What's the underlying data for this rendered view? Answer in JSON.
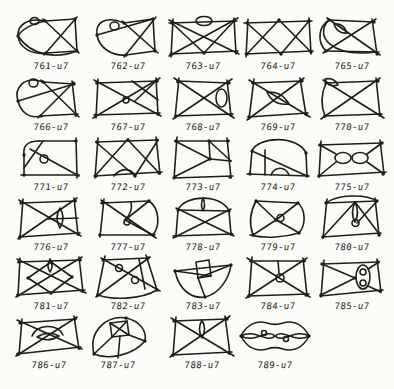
{
  "plate": {
    "title": "hand-drawn knot diagram table",
    "ink": "#211d18",
    "paper": "#fcfcf9",
    "cells": [
      {
        "label": "761-u7",
        "paths": [
          "M32,8 L62,6",
          "M62,6 L64,38",
          "M64,38 L33,40",
          "M30,6 L66,40",
          "M64,4 L31,42",
          "M32,8 C14,4 4,13 5,23 C6,34 18,42 33,40",
          "M32,8 C18,11 8,17 5,23",
          "M5,23 C20,45 46,45 64,38",
          "M17,8 a4.5,3.5 0 1,0 9,0 a4.5,3.5 0 1,0 -9,0"
        ],
        "dots": [
          [
            32,
            8
          ],
          [
            62,
            6
          ],
          [
            64,
            38
          ],
          [
            33,
            40
          ],
          [
            5,
            23
          ]
        ]
      },
      {
        "label": "762-u7",
        "paths": [
          "M34,10 L63,6",
          "M63,6 L65,38",
          "M65,38 L36,42",
          "M32,8 L68,40",
          "M66,4 L34,44",
          "M34,10 C15,2 5,10 7,22 C9,35 22,43 36,42",
          "M7,22 L63,6",
          "M20,13 a4.5,4 0 1,0 9,0 a4.5,4 0 1,0 -9,0"
        ],
        "dots": [
          [
            34,
            10
          ],
          [
            63,
            6
          ],
          [
            65,
            38
          ],
          [
            36,
            42
          ],
          [
            7,
            22
          ]
        ]
      },
      {
        "label": "763-u7",
        "paths": [
          "M4,10 L72,8",
          "M69,5 L71,41",
          "M73,38 L5,41",
          "M8,6 L6,44",
          "M4,7 L74,41",
          "M4,43 L73,5",
          "M7,10 L39,40",
          "M69,8 L39,40",
          "M31,8 a8,4.5 0 1,0 16,0 a8,4.5 0 1,0 -16,0"
        ],
        "dots": [
          [
            7,
            10
          ],
          [
            69,
            8
          ],
          [
            71,
            39
          ],
          [
            7,
            41
          ],
          [
            39,
            40
          ]
        ]
      },
      {
        "label": "764-u7",
        "paths": [
          "M4,10 L72,8",
          "M69,5 L71,41",
          "M73,38 L5,41",
          "M8,6 L6,44",
          "M7,10 L41,41",
          "M69,8 L41,41",
          "M7,41 L39,7",
          "M71,39 L39,7"
        ],
        "dots": [
          [
            7,
            10
          ],
          [
            69,
            8
          ],
          [
            71,
            39
          ],
          [
            7,
            41
          ],
          [
            39,
            7
          ],
          [
            41,
            41
          ]
        ]
      },
      {
        "label": "765-u7",
        "paths": [
          "M15,7 L60,9",
          "M58,6 L63,41",
          "M65,39 L12,38",
          "M15,7 C4,14 3,29 12,38",
          "M15,7 C0,22 16,45 63,39",
          "M13,5 L66,42",
          "M62,6 L9,40",
          "M20,11 Q30,10 33,20 Q23,21 20,11"
        ],
        "dots": [
          [
            15,
            7
          ],
          [
            60,
            9
          ],
          [
            63,
            41
          ],
          [
            12,
            38
          ]
        ]
      },
      {
        "label": "766-u7",
        "paths": [
          "M30,8 L61,10",
          "M59,7 L63,42",
          "M65,40 L27,42",
          "M30,8 C10,1 1,15 5,27 C8,39 17,45 28,42",
          "M16,9 a4.5,4 0 1,0 9,0 a4.5,4 0 1,0 -9,0",
          "M28,6 L66,43",
          "M61,8 L25,44",
          "M5,27 L61,10"
        ],
        "dots": [
          [
            30,
            8
          ],
          [
            61,
            10
          ],
          [
            63,
            41
          ],
          [
            28,
            42
          ],
          [
            5,
            27
          ]
        ]
      },
      {
        "label": "767-u7",
        "paths": [
          "M6,9 L68,7",
          "M66,4 L68,41",
          "M70,39 L4,41",
          "M8,5 L6,44",
          "M4,6 L71,42",
          "M3,44 L70,4",
          "M42,7 L68,26",
          "M66,7 L45,27",
          "M33,26 a3,3 0 1,0 6,0 a3,3 0 1,0 -6,0"
        ],
        "dots": [
          [
            7,
            9
          ],
          [
            67,
            7
          ],
          [
            68,
            40
          ],
          [
            6,
            41
          ]
        ]
      },
      {
        "label": "768-u7",
        "paths": [
          "M12,7 L64,9",
          "M62,6 L66,42",
          "M68,40 L10,42",
          "M14,4 L10,44",
          "M9,4 L69,44",
          "M67,5 L8,45",
          "M51,24 a5.5,9 0 1,0 11,0 a5.5,9 0 1,0 -11,0"
        ],
        "dots": [
          [
            13,
            8
          ],
          [
            64,
            9
          ],
          [
            66,
            41
          ],
          [
            11,
            42
          ]
        ]
      },
      {
        "label": "769-u7",
        "paths": [
          "M12,9 L62,7",
          "M60,4 L66,41",
          "M68,39 L8,43",
          "M14,5 L9,45",
          "M9,6 L70,43",
          "M64,4 L7,46",
          "M27,18 Q42,17 49,30 Q33,32 27,18"
        ],
        "dots": [
          [
            13,
            9
          ],
          [
            62,
            7
          ],
          [
            66,
            40
          ],
          [
            9,
            43
          ]
        ]
      },
      {
        "label": "770-u7",
        "paths": [
          "M12,9 L64,7",
          "M62,4 L66,42",
          "M68,40 L10,42",
          "M12,9 C7,20 7,32 11,42",
          "M9,6 L70,44",
          "M66,4 L7,45",
          "M11,5 Q20,3 24,11 Q14,14 11,5"
        ],
        "dots": [
          [
            12,
            9
          ],
          [
            64,
            7
          ],
          [
            66,
            41
          ],
          [
            11,
            42
          ]
        ]
      },
      {
        "label": "771-u7",
        "paths": [
          "M26,7 L63,7",
          "M26,7 C13,7 10,13 11,21",
          "M11,21 L11,41",
          "M8,41 L66,41",
          "M63,4 L64,44",
          "M30,7 L11,34",
          "M17,15 L66,42",
          "M27,25 a4,4 0 1,0 8,0 a4,4 0 1,0 -8,0"
        ],
        "dots": [
          [
            63,
            7
          ],
          [
            11,
            41
          ],
          [
            64,
            41
          ],
          [
            11,
            21
          ]
        ]
      },
      {
        "label": "772-u7",
        "paths": [
          "M6,8 L68,6",
          "M66,3 L70,40",
          "M72,38 L4,42",
          "M8,4 L5,44",
          "M6,8 L45,42",
          "M5,42 L38,5",
          "M38,6 L70,40",
          "M68,6 L45,42",
          "M24,42 C31,33 41,34 45,42"
        ],
        "dots": [
          [
            7,
            8
          ],
          [
            67,
            6
          ],
          [
            69,
            39
          ],
          [
            6,
            42
          ],
          [
            38,
            6
          ],
          [
            45,
            42
          ]
        ]
      },
      {
        "label": "773-u7",
        "paths": [
          "M10,7 L64,7",
          "M62,4 L66,44",
          "M68,42 L8,44",
          "M12,3 L9,45",
          "M44,7 L45,25",
          "M10,7 L45,25",
          "M9,43 L45,25",
          "M45,25 L66,27",
          "M44,7 L66,27"
        ],
        "dots": [
          [
            11,
            7
          ],
          [
            63,
            7
          ],
          [
            65,
            43
          ],
          [
            10,
            43
          ],
          [
            45,
            25
          ],
          [
            44,
            7
          ]
        ]
      },
      {
        "label": "774-u7",
        "paths": [
          "M12,17 C18,2 58,1 66,19",
          "M12,17 L10,40",
          "M7,40 L69,42",
          "M66,19 L67,42",
          "M25,16 L25,41",
          "M12,17 L67,42",
          "M31,41 C35,32 45,32 49,41"
        ],
        "dots": [
          [
            12,
            17
          ],
          [
            66,
            19
          ],
          [
            10,
            40
          ],
          [
            67,
            42
          ]
        ]
      },
      {
        "label": "775-u7",
        "paths": [
          "M5,11 L68,9",
          "M66,6 L70,40",
          "M72,38 L4,42",
          "M7,7 L5,43",
          "M21,24 a8,5.5 0 1,0 16,0 a8,5.5 0 1,0 -16,0",
          "M38,24 a8,5.5 0 1,0 16,0 a8,5.5 0 1,0 -16,0",
          "M6,11 L22,20",
          "M5,42 L22,28",
          "M68,9 L53,20",
          "M70,40 L53,28"
        ],
        "dots": [
          [
            6,
            11
          ],
          [
            68,
            9
          ],
          [
            69,
            40
          ],
          [
            5,
            42
          ]
        ]
      },
      {
        "label": "776-u7",
        "paths": [
          "M8,9 L63,7",
          "M61,4 L65,41",
          "M67,39 L6,43",
          "M10,5 L7,45",
          "M6,6 L68,42",
          "M64,4 L5,45",
          "M47,14 Q53,24 47,34 Q41,24 47,14",
          "M35,25 L65,24"
        ],
        "dots": [
          [
            8,
            9
          ],
          [
            62,
            7
          ],
          [
            65,
            40
          ],
          [
            7,
            43
          ]
        ]
      },
      {
        "label": "777-u7",
        "paths": [
          "M12,9 L59,7",
          "M59,7 C70,15 70,32 63,41",
          "M65,41 L9,41",
          "M14,5 L10,43",
          "M11,6 L66,44",
          "M59,7 L35,26",
          "M41,8 C43,16 38,23 35,26",
          "M35,26 L63,41",
          "M34,28 a3,3 0 1,0 6,0 a3,3 0 1,0 -6,0"
        ],
        "dots": [
          [
            12,
            9
          ],
          [
            59,
            7
          ],
          [
            63,
            41
          ],
          [
            10,
            41
          ]
        ]
      },
      {
        "label": "778-u7",
        "paths": [
          "M13,16 C20,0 57,0 64,17",
          "M13,16 L64,17",
          "M13,16 L11,42",
          "M8,42 L68,40",
          "M64,17 L66,40",
          "M11,14 L69,42",
          "M66,15 L8,44",
          "M38,4 Q35,11 38,17 Q41,11 38,4"
        ],
        "dots": [
          [
            13,
            16
          ],
          [
            64,
            17
          ],
          [
            11,
            42
          ],
          [
            66,
            40
          ]
        ]
      },
      {
        "label": "779-u7",
        "paths": [
          "M16,7 L58,9",
          "M16,7 C10,18 9,30 13,41",
          "M10,41 C26,45 46,43 59,39",
          "M58,9 C66,16 66,31 59,39",
          "M16,7 L36,26",
          "M58,9 L36,26",
          "M36,26 C45,31 53,35 59,39",
          "M36,26 L13,41",
          "M37,24 a3.5,3.5 0 1,0 7,0 a3.5,3.5 0 1,0 -7,0"
        ],
        "dots": [
          [
            16,
            7
          ],
          [
            58,
            9
          ],
          [
            13,
            41
          ],
          [
            59,
            39
          ],
          [
            36,
            26
          ]
        ]
      },
      {
        "label": "780-u7",
        "paths": [
          "M12,9 L63,7",
          "M61,4 L65,41",
          "M67,39 L8,43",
          "M13,5 L9,44",
          "M12,9 C24,0 52,0 63,7",
          "M9,43 L41,8",
          "M41,8 Q36,19 41,28 Q46,19 41,8",
          "M38,29 a3.5,3.5 0 1,0 7,0 a3.5,3.5 0 1,0 -7,0",
          "M41,8 L66,41",
          "M43,29 L63,7"
        ],
        "dots": [
          [
            12,
            9
          ],
          [
            63,
            7
          ],
          [
            65,
            41
          ],
          [
            9,
            43
          ]
        ]
      },
      {
        "label": "781-u7",
        "paths": [
          "M5,9 L68,7",
          "M66,4 L70,39",
          "M72,37 L4,42",
          "M7,5 L5,43",
          "M4,6 L73,40",
          "M69,4 L3,44",
          "M38,9 L15,25 L38,40 L59,24 Z",
          "M37,6 Q33,13 37,19 Q41,13 37,6"
        ],
        "dots": [
          [
            6,
            9
          ],
          [
            67,
            7
          ],
          [
            69,
            38
          ],
          [
            5,
            42
          ],
          [
            38,
            9
          ],
          [
            15,
            25
          ],
          [
            38,
            40
          ],
          [
            59,
            24
          ]
        ]
      },
      {
        "label": "782-u7",
        "paths": [
          "M13,7 L58,5",
          "M56,2 L67,37",
          "M67,37 C50,47 22,47 8,42",
          "M15,3 L7,43",
          "M11,5 L70,38",
          "M60,4 L6,44",
          "M49,6 L55,36",
          "M25.5,15 a3.5,3.5 0 1,0 7,0 a3.5,3.5 0 1,0 -7,0",
          "M41.5,27 a3.5,3.5 0 1,0 7,0 a3.5,3.5 0 1,0 -7,0"
        ],
        "dots": [
          [
            13,
            7
          ],
          [
            58,
            5
          ],
          [
            67,
            37
          ],
          [
            8,
            42
          ]
        ]
      },
      {
        "label": "783-u7",
        "paths": [
          "M10,18 L66,12",
          "M10,18 C14,38 28,46 40,44 C54,41 64,26 66,12",
          "M31,9 L44,7 L46,23 L33,25 Z",
          "M33,25 L40,44",
          "M10,18 L46,23",
          "M66,12 L33,25"
        ],
        "dots": [
          [
            10,
            18
          ],
          [
            66,
            12
          ],
          [
            40,
            44
          ]
        ]
      },
      {
        "label": "784-u7",
        "paths": [
          "M10,8 L65,8",
          "M63,5 L67,43",
          "M69,41 L8,43",
          "M12,4 L9,44",
          "M7,5 L70,44",
          "M67,5 L6,45",
          "M36,25 a4,4 0 1,0 8,0 a4,4 0 1,0 -8,0",
          "M38,8 L39,20"
        ],
        "dots": [
          [
            11,
            8
          ],
          [
            64,
            8
          ],
          [
            66,
            42
          ],
          [
            9,
            43
          ]
        ]
      },
      {
        "label": "785-u7",
        "paths": [
          "M8,11 L65,9",
          "M63,6 L67,39",
          "M69,37 L6,43",
          "M10,7 L7,44",
          "M8,11 L41,25",
          "M7,42 L41,25",
          "M42,24 a7,12 0 1,0 14,0 a7,12 0 1,0 -14,0",
          "M46,19 a3,3 0 1,0 6,0 a3,3 0 1,0 -6,0",
          "M46,30 a3,3 0 1,0 6,0 a3,3 0 1,0 -6,0",
          "M65,9 L54,16",
          "M67,39 L54,33"
        ],
        "dots": [
          [
            8,
            11
          ],
          [
            64,
            9
          ],
          [
            66,
            38
          ],
          [
            7,
            42
          ],
          [
            41,
            25
          ]
        ]
      },
      {
        "label": "786-u7",
        "paths": [
          "M9,11 L65,7",
          "M63,4 L68,37",
          "M70,35 L6,42",
          "M11,7 L8,43",
          "M6,8 L71,37",
          "M66,5 L5,44",
          "M26,25 Q37,18 48,24 Q37,31 26,25",
          "M21,24 C26,12 46,11 52,23"
        ],
        "dots": [
          [
            9,
            11
          ],
          [
            64,
            7
          ],
          [
            68,
            36
          ],
          [
            7,
            42
          ]
        ]
      },
      {
        "label": "787-u7",
        "paths": [
          "M14,42 C8,18 28,3 46,6 C60,9 67,19 65,29",
          "M65,29 C52,44 28,48 14,42",
          "M30,11 L47,9 L49,23 L32,25 Z",
          "M30,11 L49,23",
          "M47,9 L32,25",
          "M32,25 L14,42",
          "M49,23 L65,29",
          "M40,24 L38,46"
        ],
        "dots": [
          [
            14,
            42
          ],
          [
            65,
            29
          ],
          [
            46,
            6
          ]
        ]
      },
      {
        "label": "788-u7",
        "paths": [
          "M10,9 L63,7",
          "M61,4 L66,42",
          "M68,40 L8,43",
          "M12,5 L9,44",
          "M7,6 L70,44",
          "M66,4 L6,45",
          "M38,8 Q33,17 38,26 Q43,17 38,8"
        ],
        "dots": [
          [
            10,
            9
          ],
          [
            63,
            7
          ],
          [
            65,
            41
          ],
          [
            9,
            43
          ]
        ]
      },
      {
        "label": "789-u7",
        "paths": [
          "M4,24 C10,12 20,8 30,11 C36,13 40,13 46,11 C56,8 66,12 72,24",
          "M4,24 C10,36 20,40 30,37 C36,35 40,35 46,37 C56,40 66,36 72,24",
          "M4,24 C18,16 30,32 38,24 C46,16 58,32 72,24",
          "M4,24 C18,32 30,16 38,24 C46,32 58,16 72,24",
          "M24.5,21 a2.5,2.5 0 1,0 5,0 a2.5,2.5 0 1,0 -5,0",
          "M46.5,27 a2.5,2.5 0 1,0 5,0 a2.5,2.5 0 1,0 -5,0"
        ],
        "dots": [
          [
            4,
            24
          ],
          [
            72,
            24
          ]
        ]
      }
    ]
  }
}
